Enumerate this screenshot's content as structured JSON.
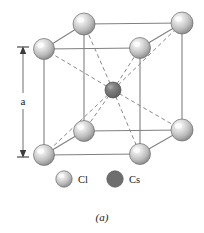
{
  "figure": {
    "caption": "(a)",
    "dimension_label": "a",
    "title_semantic": "CsCl crystal structure unit cell"
  },
  "legend": {
    "items": [
      {
        "label": "Cl",
        "color": "#c8c8c8",
        "icon": "sphere-icon"
      },
      {
        "label": "Cs",
        "color": "#6e6e6e",
        "icon": "sphere-icon"
      }
    ]
  },
  "colors": {
    "chlorine": "#c8c8c8",
    "chlorine_highlight": "#f2f2f2",
    "chlorine_shadow": "#8f8f8f",
    "chlorine_outline": "#6b6b6b",
    "cesium": "#6e6e6e",
    "cesium_highlight": "#9a9a9a",
    "cesium_outline": "#4a4a4a",
    "edge": "#808080",
    "bond": "#8a8a8a",
    "text": "#1a1a1a",
    "background": "#ffffff"
  },
  "lattice": {
    "cell_type": "simple cubic with body-center",
    "corner_atoms": [
      {
        "name": "front-top-left",
        "x": 44,
        "y": 49,
        "r": 10.5,
        "species": "Cl"
      },
      {
        "name": "front-top-right",
        "x": 140,
        "y": 48,
        "r": 10.5,
        "species": "Cl"
      },
      {
        "name": "back-top-left",
        "x": 84,
        "y": 24,
        "r": 11.0,
        "species": "Cl"
      },
      {
        "name": "back-top-right",
        "x": 182,
        "y": 23,
        "r": 11.0,
        "species": "Cl"
      },
      {
        "name": "front-bottom-left",
        "x": 44,
        "y": 155,
        "r": 10.5,
        "species": "Cl"
      },
      {
        "name": "front-bottom-right",
        "x": 140,
        "y": 154,
        "r": 10.5,
        "species": "Cl"
      },
      {
        "name": "back-bottom-left",
        "x": 84,
        "y": 131,
        "r": 10.5,
        "species": "Cl"
      },
      {
        "name": "back-bottom-right",
        "x": 182,
        "y": 130,
        "r": 11.0,
        "species": "Cl"
      }
    ],
    "center_atom": {
      "name": "body-center",
      "x": 113,
      "y": 90,
      "r": 8.0,
      "species": "Cs"
    }
  },
  "dimension": {
    "x": 23,
    "y_top": 48,
    "y_bottom": 156,
    "cap_half_width": 6
  }
}
